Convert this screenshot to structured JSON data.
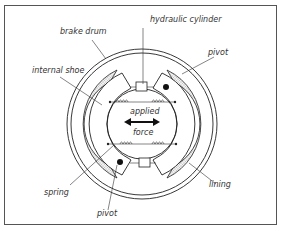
{
  "diagram": {
    "labels": {
      "hydraulic_cylinder": "hydraulic cylinder",
      "brake_drum": "brake drum",
      "pivot_top": "pivot",
      "internal_shoe": "internal shoe",
      "applied": "applied",
      "force": "force",
      "spring": "spring",
      "lining": "lining",
      "pivot_bottom": "pivot"
    },
    "colors": {
      "line": "#222222",
      "lining_fill": "#d9d9d9",
      "background": "#ffffff",
      "frame": "#555555"
    }
  }
}
